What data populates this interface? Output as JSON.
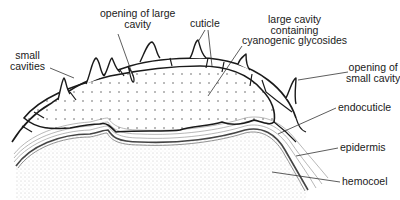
{
  "diagram": {
    "type": "cross-section illustration",
    "colors": {
      "ink": "#1a1a1a",
      "leader": "#333333",
      "background": "#ffffff",
      "stipple": "#9a9a9a"
    },
    "labels": {
      "opening_large_cavity": "opening of large\ncavity",
      "cuticle": "cuticle",
      "large_cavity": "large cavity\ncontaining\ncyanogenic glycosides",
      "small_cavities": "small\ncavities",
      "opening_small_cavity": "opening of\nsmall cavity",
      "endocuticle": "endocuticle",
      "epidermis": "epidermis",
      "hemocoel": "hemocoel"
    }
  }
}
